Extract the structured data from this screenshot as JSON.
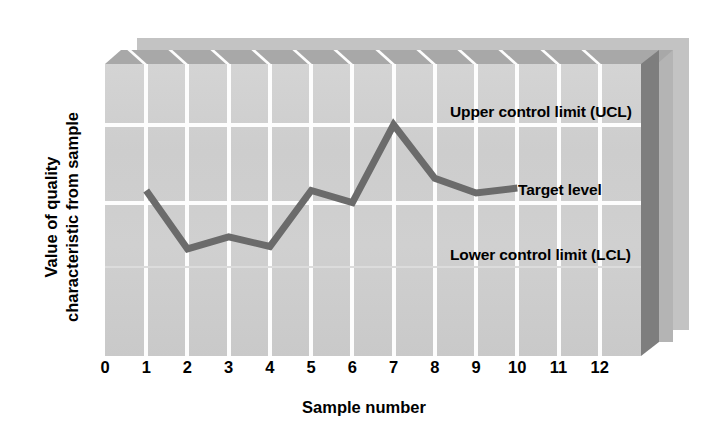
{
  "chart_data": {
    "type": "line",
    "title": "",
    "subtitle": "",
    "xlabel": "Sample number",
    "ylabel": "Value of quality\ncharacteristic from sample",
    "ylabel_lines": [
      "Value of quality",
      "characteristic from sample"
    ],
    "x": [
      1,
      2,
      3,
      4,
      5,
      6,
      7,
      8,
      9,
      10
    ],
    "values": [
      68,
      44,
      49,
      45,
      68,
      63,
      95,
      73,
      67,
      69
    ],
    "series": [
      {
        "name": "Sample measurement",
        "x": [
          1,
          2,
          3,
          4,
          5,
          6,
          7,
          8,
          9,
          10
        ],
        "values": [
          68,
          44,
          49,
          45,
          68,
          63,
          95,
          73,
          67,
          69
        ],
        "color": "#6b6b6b"
      }
    ],
    "xticks": [
      0,
      1,
      2,
      3,
      4,
      5,
      6,
      7,
      8,
      9,
      10,
      11,
      12
    ],
    "xtick_labels": [
      "0",
      "1",
      "2",
      "3",
      "4",
      "5",
      "6",
      "7",
      "8",
      "9",
      "10",
      "11",
      "12"
    ],
    "xlim": [
      0,
      13
    ],
    "ylim": [
      0,
      120
    ],
    "yticks": [],
    "ytick_labels": [],
    "grid": true,
    "grid_color": "#fdfdfd",
    "legend": false,
    "legend_position": "none",
    "reference_lines": [
      {
        "id": "ucl",
        "label": "Upper control limit (UCL)",
        "value": 95,
        "style": "solid",
        "color": "#fdfdfd"
      },
      {
        "id": "target",
        "label": "Target level",
        "value": 63,
        "style": "solid",
        "color": "#fdfdfd"
      },
      {
        "id": "lcl",
        "label": "Lower control limit (LCL)",
        "value": 36,
        "style": "faint",
        "color": "#dcdcdc"
      }
    ],
    "annotations": [
      {
        "id": "ucl-label",
        "text": "Upper control limit (UCL)"
      },
      {
        "id": "target-label",
        "text": "Target level"
      },
      {
        "id": "lcl-label",
        "text": "Lower control limit (LCL)"
      }
    ],
    "style": {
      "plot_background": "#cfcfcf",
      "back_panel_1": "#b4b4b4",
      "back_panel_2": "#c3c3c3",
      "top_face": "#a8a8a8",
      "right_face": "#7e7e7e",
      "page_background": "#ffffff",
      "text_color": "#000000",
      "three_d": true
    }
  },
  "axes": {
    "x_title": "Sample number",
    "y_title_line1": "Value of quality",
    "y_title_line2": "characteristic from sample"
  },
  "labels": {
    "ucl": "Upper control limit (UCL)",
    "target": "Target level",
    "lcl": "Lower control limit (LCL)"
  }
}
